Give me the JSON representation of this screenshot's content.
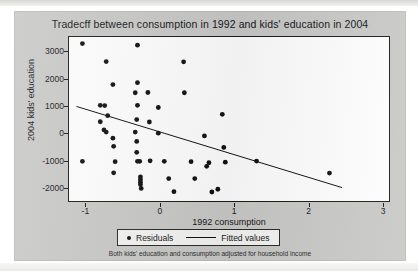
{
  "figure": {
    "title": "Tradecff between consumption in 1992 and kids' education in 2004",
    "footnote": "Both kids' education and consumption adjusted for household income",
    "background_color": "#c9c9c7",
    "plot_background_color": "#fefefe",
    "marker_color": "#111111",
    "line_color": "#111111"
  },
  "legend": {
    "position": "below-axis-centered",
    "entries": [
      {
        "label": "Residuals",
        "symbol": "dot"
      },
      {
        "label": "Fitted values",
        "symbol": "line"
      }
    ]
  },
  "chart_data": {
    "type": "scatter",
    "title": "Tradecff between consumption in 1992 and kids' education in 2004",
    "subtitle": "Both kids' education and consumption adjusted for household income",
    "xlabel": "1992 consumption",
    "ylabel": "2004 kids' education",
    "xlim": [
      -1.22,
      3.08
    ],
    "ylim": [
      -2480,
      3520
    ],
    "xticks": [
      -1,
      0,
      1,
      2,
      3
    ],
    "xtick_labels": [
      "-1",
      "0",
      "1",
      "2",
      "3"
    ],
    "yticks": [
      3000,
      2000,
      1000,
      0,
      -1000,
      -2000
    ],
    "ytick_labels": [
      "3000",
      "2000",
      "1000",
      "0",
      "-1000",
      "-2000"
    ],
    "grid": false,
    "legend_position": "bottom",
    "series": [
      {
        "name": "Residuals",
        "type": "scatter",
        "marker": "circle",
        "color": "#111111",
        "points": [
          [
            -1.04,
            3280
          ],
          [
            -1.04,
            -1030
          ],
          [
            -0.72,
            2620
          ],
          [
            -0.63,
            1780
          ],
          [
            -0.8,
            1020
          ],
          [
            -0.74,
            1010
          ],
          [
            -0.7,
            640
          ],
          [
            -0.8,
            420
          ],
          [
            -0.75,
            120
          ],
          [
            -0.72,
            40
          ],
          [
            -0.63,
            -180
          ],
          [
            -0.62,
            -480
          ],
          [
            -0.6,
            -1040
          ],
          [
            -0.62,
            -1450
          ],
          [
            -0.3,
            3220
          ],
          [
            -0.3,
            1850
          ],
          [
            -0.33,
            1480
          ],
          [
            -0.3,
            1020
          ],
          [
            -0.31,
            500
          ],
          [
            -0.33,
            40
          ],
          [
            -0.31,
            -300
          ],
          [
            -0.31,
            -700
          ],
          [
            -0.3,
            -1030
          ],
          [
            -0.27,
            -1030
          ],
          [
            -0.26,
            -1600
          ],
          [
            -0.26,
            -1700
          ],
          [
            -0.26,
            -1790
          ],
          [
            -0.26,
            -1880
          ],
          [
            -0.25,
            -2020
          ],
          [
            -0.16,
            1490
          ],
          [
            -0.14,
            410
          ],
          [
            -0.13,
            -1010
          ],
          [
            -0.02,
            940
          ],
          [
            -0.02,
            0
          ],
          [
            0.06,
            -1030
          ],
          [
            0.12,
            -1660
          ],
          [
            0.19,
            -2140
          ],
          [
            0.32,
            2610
          ],
          [
            0.33,
            1480
          ],
          [
            0.42,
            -1040
          ],
          [
            0.47,
            -1660
          ],
          [
            0.6,
            -100
          ],
          [
            0.63,
            -1210
          ],
          [
            0.66,
            -1080
          ],
          [
            0.7,
            -2150
          ],
          [
            0.78,
            -2050
          ],
          [
            0.84,
            690
          ],
          [
            0.86,
            -520
          ],
          [
            0.88,
            -1060
          ],
          [
            1.3,
            -1020
          ],
          [
            2.28,
            -1460
          ]
        ]
      },
      {
        "name": "Fitted values",
        "type": "line",
        "color": "#111111",
        "x": [
          -1.12,
          2.45
        ],
        "y": [
          980,
          -1990
        ]
      }
    ]
  }
}
